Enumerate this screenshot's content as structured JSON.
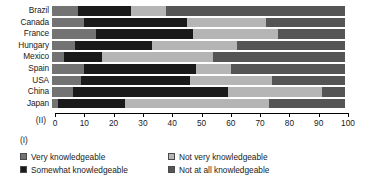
{
  "chart_data": {
    "type": "bar",
    "orientation": "horizontal",
    "stacked": true,
    "title": "",
    "xlabel": "",
    "ylabel": "",
    "xlim": [
      0,
      100
    ],
    "grid": false,
    "legend_position": "bottom",
    "axis_corner_label": "(II)",
    "legend_note": "(I)",
    "categories": [
      "Brazil",
      "Canada",
      "France",
      "Hungary",
      "Mexico",
      "Spain",
      "USA",
      "China",
      "Japan"
    ],
    "tick_labels": [
      "0",
      "10",
      "20",
      "30",
      "40",
      "50",
      "60",
      "70",
      "80",
      "90",
      "100"
    ],
    "tick_values": [
      0,
      10,
      20,
      30,
      40,
      50,
      60,
      70,
      80,
      90,
      100
    ],
    "series": [
      {
        "name": "Very knowledgeable",
        "color": "#737373",
        "values": [
          9,
          11,
          15,
          8,
          4,
          11,
          10,
          7,
          2
        ]
      },
      {
        "name": "Somewhat knowledgeable",
        "color": "#1a1a1a",
        "values": [
          18,
          35,
          33,
          26,
          13,
          38,
          37,
          53,
          23
        ]
      },
      {
        "name": "Not very knowledgeable",
        "color": "#b5b5b5",
        "values": [
          12,
          27,
          29,
          29,
          38,
          12,
          28,
          32,
          49
        ]
      },
      {
        "name": "Not at all knowledgeable",
        "color": "#555555",
        "values": [
          61,
          27,
          23,
          37,
          45,
          39,
          25,
          8,
          26
        ]
      }
    ]
  }
}
